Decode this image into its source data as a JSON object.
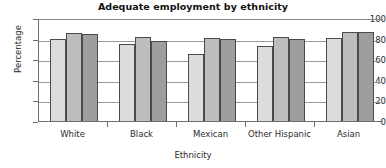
{
  "chart_data": {
    "type": "bar",
    "title": "Adequate employment by ethnicity",
    "xlabel": "Ethnicity",
    "ylabel": "Percentage",
    "categories": [
      "White",
      "Black",
      "Mexican",
      "Other Hispanic",
      "Asian"
    ],
    "series": [
      {
        "name": "series-1",
        "color": "#dcdcdc",
        "values": [
          80,
          75,
          65,
          73,
          81
        ]
      },
      {
        "name": "series-2",
        "color": "#bdbdbd",
        "values": [
          85,
          82,
          81,
          82,
          86
        ]
      },
      {
        "name": "series-3",
        "color": "#9e9e9e",
        "values": [
          84,
          78,
          80,
          80,
          86
        ]
      }
    ],
    "ylim": [
      0,
      100
    ],
    "yticks": [
      0,
      20,
      40,
      60,
      80,
      100
    ],
    "ytick_labels": [
      "0",
      "20",
      "40",
      "60",
      "80",
      "100"
    ],
    "grid": "horizontal",
    "legend": "none",
    "bar_border_color": "#4a4a4a",
    "axis_color": "#6e6e6e",
    "gridline_color": "#9a9a9a"
  }
}
